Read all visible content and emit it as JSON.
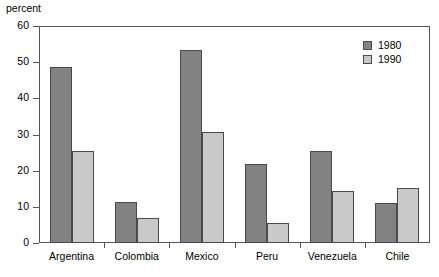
{
  "chart_data": {
    "type": "bar",
    "title": "",
    "xlabel": "",
    "ylabel": "percent",
    "ylim": [
      0,
      60
    ],
    "yticks": [
      0,
      10,
      20,
      30,
      40,
      50,
      60
    ],
    "grid": false,
    "legend_position": "top-right",
    "categories": [
      "Argentina",
      "Colombia",
      "Mexico",
      "Peru",
      "Venezuela",
      "Chile"
    ],
    "series": [
      {
        "name": "1980",
        "color": "#828282",
        "values": [
          48.6,
          11.2,
          53.5,
          21.8,
          25.4,
          11.0
        ]
      },
      {
        "name": "1990",
        "color": "#c9c9c9",
        "values": [
          25.4,
          6.9,
          30.6,
          5.5,
          14.3,
          15.1
        ]
      }
    ]
  },
  "legend": {
    "items": [
      {
        "label": "1980"
      },
      {
        "label": "1990"
      }
    ]
  },
  "axis": {
    "unit_label": "percent"
  }
}
